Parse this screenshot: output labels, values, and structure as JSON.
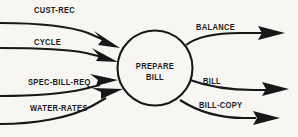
{
  "diagram": {
    "background_color": "#f7f6f2",
    "ink_color": "#17171a",
    "process": {
      "name": "prepare-bill",
      "label_line1": "PREPARE",
      "label_line2": "BILL",
      "shape": "circle",
      "cx": 155,
      "cy": 68,
      "r": 37.5
    },
    "inputs": [
      {
        "label": "CUST-REC",
        "label_x": 34,
        "label_y": 5
      },
      {
        "label": "CYCLE",
        "label_x": 34,
        "label_y": 37
      },
      {
        "label": "SPEC-BILL-REQ",
        "label_x": 28,
        "label_y": 77
      },
      {
        "label": "WATER-RATES",
        "label_x": 30,
        "label_y": 103
      }
    ],
    "outputs": [
      {
        "label": "BALANCE",
        "label_x": 196,
        "label_y": 22
      },
      {
        "label": "BILL",
        "label_x": 203,
        "label_y": 76
      },
      {
        "label": "BILL-COPY",
        "label_x": 199,
        "label_y": 100
      }
    ]
  }
}
